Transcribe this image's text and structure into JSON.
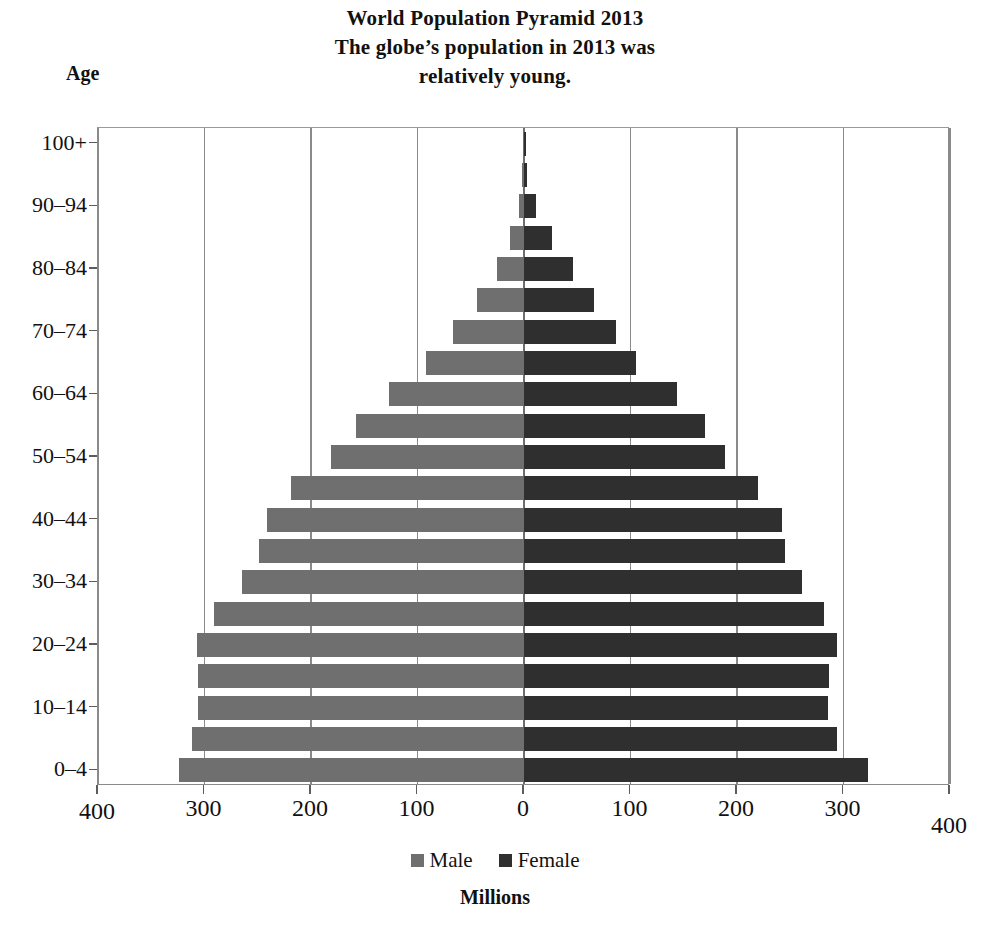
{
  "chart_data": {
    "type": "bar",
    "subtype": "population-pyramid",
    "title": "World Population Pyramid 2013",
    "subtitle_line1": "The globe’s population in 2013 was",
    "subtitle_line2": "relatively young.",
    "title_lines": [
      "World Population Pyramid 2013",
      "The globe’s population in 2013 was",
      "relatively young."
    ],
    "xlabel": "Millions",
    "ylabel": "Age",
    "grid": true,
    "legend_position": "bottom",
    "xlim": [
      -400,
      400
    ],
    "xticks": [
      400,
      300,
      200,
      100,
      0,
      100,
      200,
      300,
      400
    ],
    "xtick_labels": [
      "400",
      "300",
      "200",
      "100",
      "0",
      "100",
      "200",
      "300",
      "400"
    ],
    "categories": [
      "0–4",
      "5–9",
      "10–14",
      "15–19",
      "20–24",
      "25–29",
      "30–34",
      "35–39",
      "40–44",
      "45–49",
      "50–54",
      "55–59",
      "60–64",
      "65–69",
      "70–74",
      "75–79",
      "80–84",
      "85–89",
      "90–94",
      "95–99",
      "100+"
    ],
    "visible_ytick_labels": [
      "0–4",
      "10–14",
      "20–24",
      "30–34",
      "40–44",
      "50–54",
      "60–64",
      "70–74",
      "80–84",
      "90–94",
      "100+"
    ],
    "series": [
      {
        "name": "Male",
        "color": "#6f6f6f",
        "side": "left",
        "values": [
          324,
          312,
          306,
          306,
          307,
          291,
          265,
          249,
          241,
          219,
          181,
          158,
          127,
          92,
          67,
          44,
          25,
          13,
          5,
          1.5,
          0.3
        ]
      },
      {
        "name": "Female",
        "color": "#2f2f2f",
        "side": "right",
        "values": [
          323,
          294,
          285,
          286,
          294,
          282,
          261,
          245,
          242,
          220,
          189,
          170,
          144,
          105,
          86,
          66,
          46,
          26,
          11,
          3,
          0.6
        ]
      }
    ]
  },
  "legend": {
    "items": [
      {
        "label": "Male",
        "color": "#6f6f6f"
      },
      {
        "label": "Female",
        "color": "#2f2f2f"
      }
    ]
  }
}
